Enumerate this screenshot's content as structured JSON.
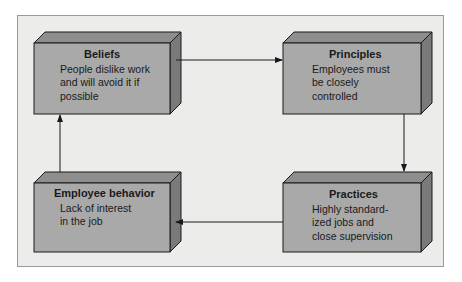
{
  "diagram": {
    "colors": {
      "background": "#ececea",
      "box_front": "#a9a9a9",
      "box_top": "#8e8e8e",
      "box_side": "#7a7a7a",
      "line": "#1a1a1a"
    },
    "boxes": [
      {
        "id": "beliefs",
        "title": "Beliefs",
        "body": "People dislike work\nand will avoid it if\npossible"
      },
      {
        "id": "principles",
        "title": "Principles",
        "body": "Employees must\nbe closely\ncontrolled"
      },
      {
        "id": "practices",
        "title": "Practices",
        "body": "Highly standard-\nized jobs and\nclose supervision"
      },
      {
        "id": "employee-behavior",
        "title": "Employee behavior",
        "body": "Lack of interest\nin the job"
      }
    ],
    "edges": [
      {
        "from": "Beliefs",
        "to": "Principles"
      },
      {
        "from": "Principles",
        "to": "Practices"
      },
      {
        "from": "Practices",
        "to": "Employee behavior"
      },
      {
        "from": "Employee behavior",
        "to": "Beliefs"
      }
    ]
  }
}
